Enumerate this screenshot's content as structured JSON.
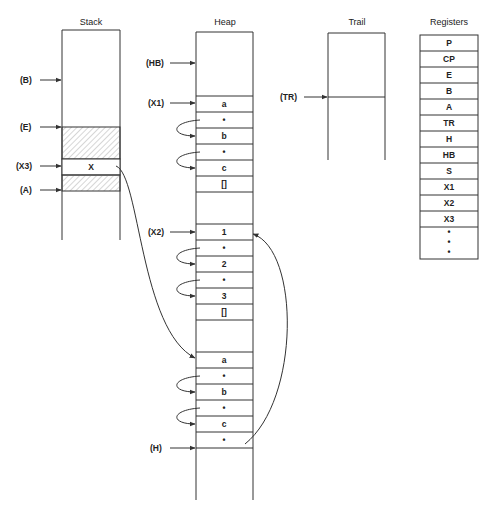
{
  "titles": {
    "stack": "Stack",
    "heap": "Heap",
    "trail": "Trail",
    "registers": "Registers"
  },
  "stack": {
    "pointers": [
      "(B)",
      "(E)",
      "(X3)",
      "(A)"
    ],
    "cell_x": "X"
  },
  "heap": {
    "pointers": [
      "(HB)",
      "(X1)",
      "(X2)",
      "(H)"
    ],
    "list1": [
      "a",
      "•",
      "b",
      "•",
      "c",
      "[]"
    ],
    "list2": [
      "1",
      "•",
      "2",
      "•",
      "3",
      "[]"
    ],
    "list3": [
      "a",
      "•",
      "b",
      "•",
      "c",
      "•"
    ]
  },
  "trail": {
    "pointer": "(TR)"
  },
  "registers": {
    "items": [
      "P",
      "CP",
      "E",
      "B",
      "A",
      "TR",
      "H",
      "HB",
      "S",
      "X1",
      "X2",
      "X3"
    ],
    "ellipsis": "•"
  },
  "colors": {
    "line": "#333333",
    "hatch": "#888888",
    "background": "#ffffff"
  }
}
